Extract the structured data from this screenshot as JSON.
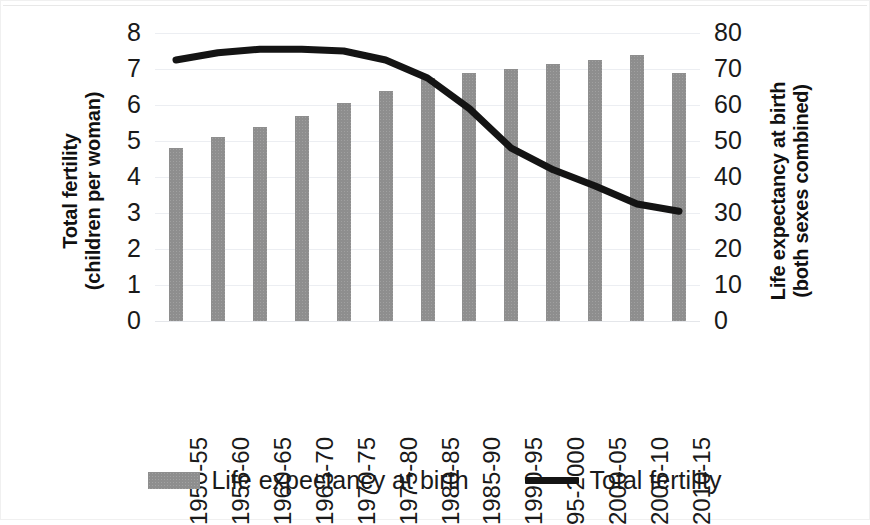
{
  "chart_data": {
    "type": "bar",
    "title": "",
    "subtitle": "",
    "categories": [
      "1950-55",
      "1955-60",
      "1960-65",
      "1965-70",
      "1970-75",
      "1975-80",
      "1980-85",
      "1985-90",
      "1990-95",
      "95-2000",
      "2000-05",
      "2005-10",
      "2010-15"
    ],
    "series": [
      {
        "name": "Life expectancy at birth",
        "type": "bar",
        "axis": "right",
        "unit": "years",
        "color": "#8e8e8e",
        "values": [
          48,
          51,
          54,
          57,
          60.5,
          64,
          67.5,
          69,
          70,
          71.5,
          72.5,
          74,
          69
        ]
      },
      {
        "name": "Total fertility",
        "type": "line",
        "axis": "left",
        "unit": "children per woman",
        "color": "#141414",
        "values": [
          7.25,
          7.45,
          7.55,
          7.55,
          7.5,
          7.25,
          6.75,
          5.9,
          4.8,
          4.2,
          3.75,
          3.25,
          3.05
        ]
      }
    ],
    "left_axis": {
      "label_line1": "Total fertility",
      "label_line2": "(children per woman)",
      "ticks": [
        0,
        1,
        2,
        3,
        4,
        5,
        6,
        7,
        8
      ],
      "min": 0,
      "max": 8
    },
    "right_axis": {
      "label_line1": "Life expectancy at birth",
      "label_line2": "(both sexes combined)",
      "ticks": [
        0,
        10,
        20,
        30,
        40,
        50,
        60,
        70,
        80
      ],
      "min": 0,
      "max": 80
    },
    "xlabel": "",
    "grid": true,
    "legend_position": "bottom",
    "legend": [
      {
        "label": "Life expectancy at birth",
        "marker": "bar-swatch",
        "color": "#8e8e8e"
      },
      {
        "label": "Total fertility",
        "marker": "line-swatch",
        "color": "#141414"
      }
    ]
  }
}
